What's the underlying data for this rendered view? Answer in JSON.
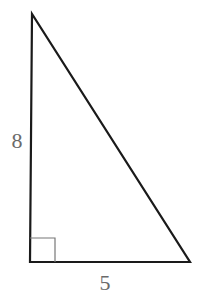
{
  "diagram": {
    "type": "right-triangle",
    "labels": {
      "vertical_leg": "8",
      "horizontal_leg": "5"
    },
    "right_angle_marker": true,
    "colors": {
      "stroke": "#1a1a1a",
      "marker": "#777777",
      "label": "#6a6a6a"
    }
  }
}
